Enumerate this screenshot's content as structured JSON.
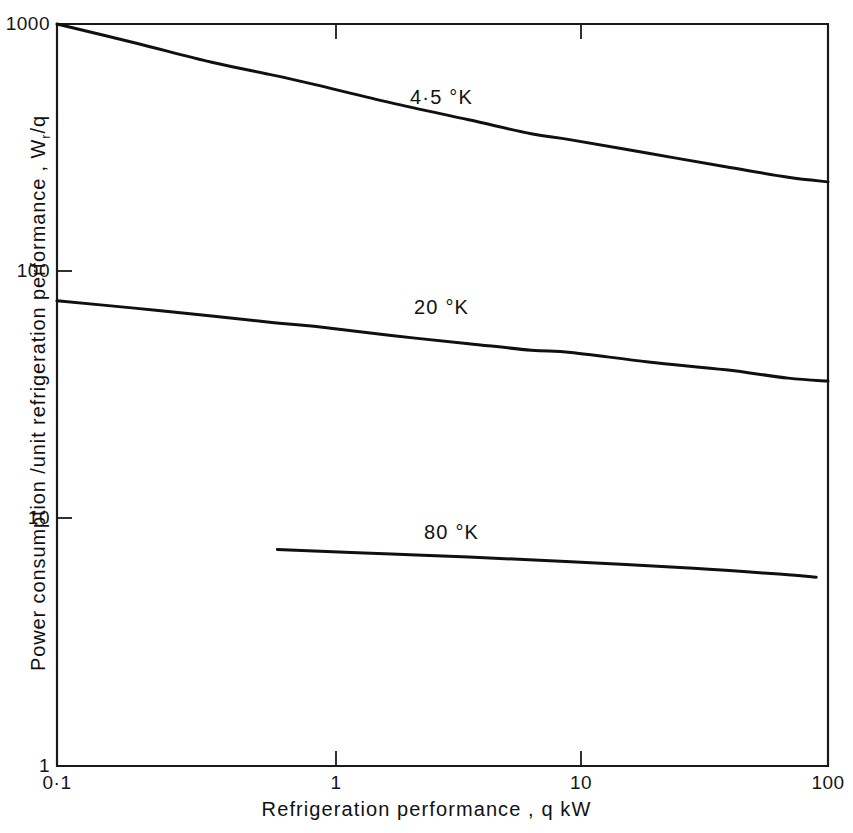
{
  "chart_data": {
    "type": "line",
    "title": "",
    "xlabel": "Refrigeration  performance ,  q  kW",
    "ylabel_text": "Power  consumption /unit  refrigeration  performance ,  W",
    "ylabel_sub": "r",
    "ylabel_tail": "/q",
    "xscale": "log",
    "yscale": "log",
    "xlim": [
      0.1,
      100
    ],
    "ylim": [
      1,
      1000
    ],
    "grid": false,
    "legend": "inline-curve-labels",
    "xticks": [
      {
        "value": 0.1,
        "label": "0·1"
      },
      {
        "value": 1,
        "label": "1"
      },
      {
        "value": 10,
        "label": "10"
      },
      {
        "value": 100,
        "label": "100"
      }
    ],
    "yticks": [
      {
        "value": 1,
        "label": "1"
      },
      {
        "value": 10,
        "label": "10"
      },
      {
        "value": 100,
        "label": "100"
      },
      {
        "value": 1000,
        "label": "1000"
      }
    ],
    "series": [
      {
        "name": "4·5 °K",
        "label": "4·5 °K",
        "x": [
          0.1,
          0.2,
          0.4,
          0.7,
          1.0,
          2.0,
          4.0,
          7.0,
          10.0,
          20.0,
          40.0,
          70.0,
          100.0
        ],
        "values": [
          1000,
          840,
          700,
          620,
          570,
          480,
          410,
          360,
          340,
          300,
          265,
          240,
          230
        ]
      },
      {
        "name": "20 °K",
        "label": "20 °K",
        "x": [
          0.1,
          0.2,
          0.4,
          0.7,
          1.0,
          2.0,
          4.0,
          7.0,
          10.0,
          20.0,
          40.0,
          70.0,
          100.0
        ],
        "values": [
          76,
          71,
          66,
          62,
          60,
          55,
          51,
          48,
          47,
          43,
          40,
          37,
          36
        ]
      },
      {
        "name": "80 °K",
        "label": "80 °K",
        "x": [
          0.72,
          1.0,
          2.0,
          4.0,
          10.0,
          30.0,
          60.0,
          90.0
        ],
        "values": [
          7.5,
          7.4,
          7.2,
          7.0,
          6.7,
          6.3,
          6.0,
          5.8
        ]
      }
    ],
    "series_label_positions": [
      {
        "name": "4·5 °K",
        "x": 3.0,
        "y": 650
      },
      {
        "name": "20 °K",
        "x": 3.0,
        "y": 78
      },
      {
        "name": "80 °K",
        "x": 4.0,
        "y": 9.2
      }
    ],
    "colors": {
      "axis": "#1a1a1a",
      "curve": "#101010",
      "background": "#ffffff",
      "text": "#111111"
    }
  }
}
